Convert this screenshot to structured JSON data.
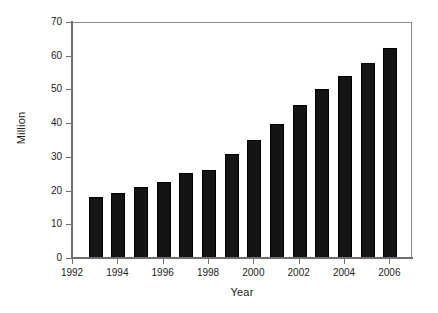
{
  "chart_data": {
    "type": "bar",
    "title": "",
    "xlabel": "Year",
    "ylabel": "Million",
    "categories": [
      1993,
      1994,
      1995,
      1996,
      1997,
      1998,
      1999,
      2000,
      2001,
      2002,
      2003,
      2004,
      2005,
      2006
    ],
    "values": [
      18.4,
      19.6,
      21.3,
      22.8,
      25.4,
      26.5,
      31.0,
      35.3,
      39.9,
      45.8,
      50.5,
      54.3,
      58.0,
      62.6
    ],
    "xlim": [
      1992,
      2007
    ],
    "ylim": [
      0,
      70
    ],
    "ytick_values": [
      0,
      10,
      20,
      30,
      40,
      50,
      60,
      70
    ],
    "ytick_labels": [
      "0",
      "10",
      "20",
      "30",
      "40",
      "50",
      "60",
      "70"
    ],
    "xtick_values": [
      1992,
      1994,
      1996,
      1998,
      2000,
      2002,
      2004,
      2006
    ],
    "xtick_labels": [
      "1992",
      "1994",
      "1996",
      "1998",
      "2000",
      "2002",
      "2004",
      "2006"
    ],
    "grid": false,
    "legend": false,
    "bar_color": "#141414",
    "axis_color": "#6f6f6f",
    "background_color": "#ffffff"
  }
}
